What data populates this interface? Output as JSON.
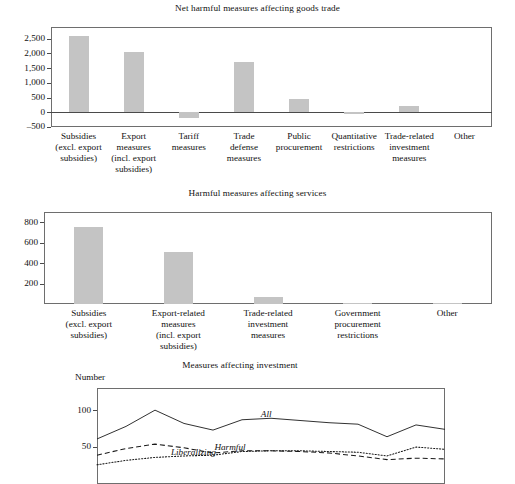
{
  "figure": {
    "panels": [
      "goods",
      "services",
      "investment"
    ]
  },
  "chart_data": [
    {
      "id": "goods",
      "type": "bar",
      "title": "Net harmful measures affecting goods trade",
      "xlabel": "",
      "ylabel": "",
      "ylim": [
        -500,
        2900
      ],
      "yticks": [
        -500,
        0,
        500,
        1000,
        1500,
        2000,
        2500
      ],
      "ytick_labels": [
        "–500",
        "0",
        "500",
        "1,000",
        "1,500",
        "2,000",
        "2,500"
      ],
      "grid": false,
      "legend": "none",
      "bar_color": "#c4c4c4",
      "categories": [
        "Subsidies\n(excl. export\nsubsidies)",
        "Export\nmeasures\n(incl. export\nsubsidies)",
        "Tariff\nmeasures",
        "Trade\ndefense\nmeasures",
        "Public\nprocurement",
        "Quantitative\nrestrictions",
        "Trade-related\ninvestment\nmeasures",
        "Other"
      ],
      "values": [
        2600,
        2050,
        -200,
        1710,
        450,
        -70,
        200,
        0
      ]
    },
    {
      "id": "services",
      "type": "bar",
      "title": "Harmful measures affecting services",
      "xlabel": "",
      "ylabel": "",
      "ylim": [
        0,
        900
      ],
      "yticks": [
        200,
        400,
        600,
        800
      ],
      "ytick_labels": [
        "200",
        "400",
        "600",
        "800"
      ],
      "grid": false,
      "legend": "none",
      "bar_color": "#c4c4c4",
      "categories": [
        "Subsidies\n(excl. export\nsubsidies)",
        "Export-related\nmeasures\n(incl. export\nsubsidies)",
        "Trade-related\ninvestment\nmeasures",
        "Government\nprocurement\nrestrictions",
        "Other"
      ],
      "values": [
        755,
        505,
        70,
        12,
        10
      ]
    },
    {
      "id": "investment",
      "type": "line",
      "title": "Measures affecting investment",
      "axis_name": "Number",
      "xlabel": "",
      "ylabel": "Number",
      "ylim": [
        0,
        130
      ],
      "yticks": [
        50,
        100
      ],
      "ytick_labels": [
        "50",
        "100"
      ],
      "grid": false,
      "legend": "inline-labels",
      "x": [
        0,
        1,
        2,
        3,
        4,
        5,
        6,
        7,
        8,
        9,
        10,
        11,
        12
      ],
      "series": [
        {
          "name": "All",
          "style": "solid",
          "label_x": 6.2,
          "values": [
            61,
            78,
            100,
            82,
            73,
            87,
            89,
            86,
            83,
            81,
            64,
            80,
            74
          ]
        },
        {
          "name": "Harmful",
          "style": "dashed",
          "label_x": 4.6,
          "values": [
            39,
            48,
            54,
            49,
            42,
            45,
            45,
            44,
            42,
            38,
            33,
            35,
            34
          ]
        },
        {
          "name": "Liberalizing",
          "style": "dotted",
          "label_x": 3.1,
          "values": [
            26,
            32,
            36,
            38,
            39,
            44,
            45,
            45,
            44,
            43,
            38,
            50,
            47
          ]
        }
      ]
    }
  ]
}
